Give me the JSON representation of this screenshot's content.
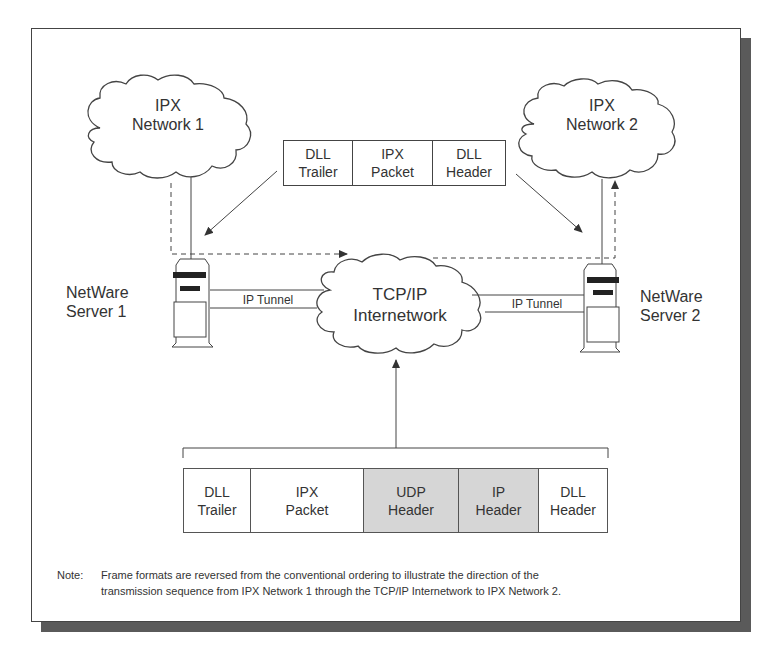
{
  "diagram": {
    "clouds": {
      "ipx_network_1": {
        "line1": "IPX",
        "line2": "Network 1"
      },
      "ipx_network_2": {
        "line1": "IPX",
        "line2": "Network 2"
      },
      "tcpip": {
        "line1": "TCP/IP",
        "line2": "Internetwork"
      }
    },
    "servers": {
      "server_1": {
        "line1": "NetWare",
        "line2": "Server 1"
      },
      "server_2": {
        "line1": "NetWare",
        "line2": "Server 2"
      }
    },
    "tunnels": {
      "left": "IP Tunnel",
      "right": "IP Tunnel"
    },
    "ipx_frame": [
      {
        "label": "DLL\nTrailer",
        "shaded": false
      },
      {
        "label": "IPX\nPacket",
        "shaded": false
      },
      {
        "label": "DLL\nHeader",
        "shaded": false
      }
    ],
    "tunnel_frame": [
      {
        "label": "DLL\nTrailer",
        "shaded": false
      },
      {
        "label": "IPX\nPacket",
        "shaded": false
      },
      {
        "label": "UDP\nHeader",
        "shaded": true
      },
      {
        "label": "IP\nHeader",
        "shaded": true
      },
      {
        "label": "DLL\nHeader",
        "shaded": false
      }
    ],
    "note": {
      "label": "Note:",
      "text_line1": "Frame formats are reversed from the conventional ordering to illustrate the direction of the",
      "text_line2": "transmission sequence from IPX Network 1 through the TCP/IP Internetwork to IPX Network 2."
    },
    "colors": {
      "line": "#444444",
      "shaded_cell": "#d6d6d6",
      "shadow": "#5a5a5a"
    }
  }
}
